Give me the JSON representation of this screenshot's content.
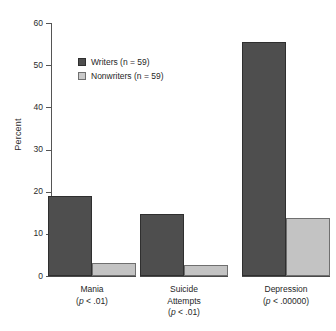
{
  "chart_data": {
    "type": "bar",
    "title": "",
    "subtitle": "",
    "xlabel": "",
    "ylabel": "Percent",
    "ylim": [
      0,
      60
    ],
    "yticks": [
      0,
      10,
      20,
      30,
      40,
      50,
      60
    ],
    "ytick_labels": [
      "0",
      "10",
      "20",
      "30",
      "40",
      "50",
      "60"
    ],
    "grid": false,
    "legend_position": "upper-left-inside",
    "categories": [
      "Mania",
      "Suicide Attempts",
      "Depression"
    ],
    "category_lines": [
      [
        "Mania"
      ],
      [
        "Suicide",
        "Attempts"
      ],
      [
        "Depression"
      ]
    ],
    "category_pvalues": [
      "(p < .01)",
      "(p < .01)",
      "(p < .00000)"
    ],
    "series": [
      {
        "name": "Writers (n = 59)",
        "color": "#4e4e4e",
        "values": [
          19.0,
          14.8,
          55.5
        ]
      },
      {
        "name": "Nonwriters (n = 59)",
        "color": "#c3c3c3",
        "values": [
          3.0,
          2.7,
          13.8
        ]
      }
    ]
  },
  "legend": {
    "items": [
      {
        "label": "Writers (n = 59)",
        "swatch": "dark"
      },
      {
        "label": "Nonwriters (n = 59)",
        "swatch": "light"
      }
    ]
  },
  "axis": {
    "y_title": "Percent"
  },
  "categories": [
    {
      "line1": "Mania",
      "line2": "",
      "p": "(p < .01)",
      "p_prefix": "(",
      "p_italic": "p",
      "p_suffix": " < .01)"
    },
    {
      "line1": "Suicide",
      "line2": "Attempts",
      "p": "(p < .01)",
      "p_prefix": "(",
      "p_italic": "p",
      "p_suffix": " < .01)"
    },
    {
      "line1": "Depression",
      "line2": "",
      "p": "(p < .00000)",
      "p_prefix": "(",
      "p_italic": "p",
      "p_suffix": " < .00000)"
    }
  ],
  "ticks": [
    {
      "label": "60",
      "value": 60
    },
    {
      "label": "50",
      "value": 50
    },
    {
      "label": "40",
      "value": 40
    },
    {
      "label": "30",
      "value": 30
    },
    {
      "label": "20",
      "value": 20
    },
    {
      "label": "10",
      "value": 10
    },
    {
      "label": "0",
      "value": 0
    }
  ]
}
